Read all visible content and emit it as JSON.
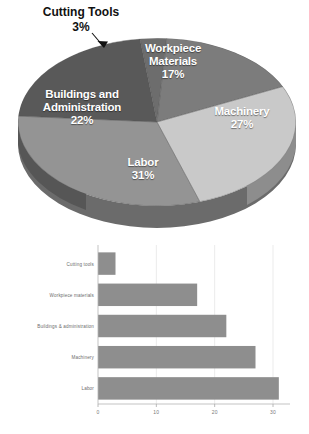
{
  "page": {
    "background": "#ffffff"
  },
  "colors": {
    "slice_workpiece": "#7c7c7c",
    "slice_machinery": "#c9c9c9",
    "slice_labor": "#949494",
    "slice_buildings": "#5a5a5a",
    "slice_cutting": "#6a6a6a",
    "pie_side_wall": "#6b6b6b",
    "bar_fill": "#8e8e8e",
    "axis": "#a8a8a8",
    "grid": "#e2e2e2",
    "label_text": "#6d6d6d",
    "callout_text": "#111111"
  },
  "pie": {
    "type": "pie",
    "title": "",
    "labels_inside": true,
    "slices": [
      {
        "name": "Workpiece Materials",
        "label": "Workpiece\nMaterials",
        "label_line1": "Workpiece",
        "label_line2": "Materials",
        "value": 17,
        "percent": "17%",
        "color": "#7c7c7c",
        "text_color": "#ffffff"
      },
      {
        "name": "Machinery",
        "label_line1": "Machinery",
        "label_line2": "",
        "value": 27,
        "percent": "27%",
        "color": "#c9c9c9",
        "text_color": "#ffffff"
      },
      {
        "name": "Labor",
        "label_line1": "Labor",
        "label_line2": "",
        "value": 31,
        "percent": "31%",
        "color": "#949494",
        "text_color": "#ffffff"
      },
      {
        "name": "Buildings and Administration",
        "label_line1": "Buildings and",
        "label_line2": "Administration",
        "value": 22,
        "percent": "22%",
        "color": "#5a5a5a",
        "text_color": "#ffffff"
      },
      {
        "name": "Cutting Tools",
        "label_line1": "Cutting Tools",
        "label_line2": "",
        "value": 3,
        "percent": "3%",
        "color": "#6a6a6a",
        "text_color": "#111111",
        "callout": true
      }
    ]
  },
  "chart_data": {
    "type": "bar",
    "orientation": "horizontal",
    "title": "",
    "xlabel": "",
    "ylabel": "",
    "categories": [
      "Cutting tools",
      "Workpiece materials",
      "Buildings & administration",
      "Machinery",
      "Labor"
    ],
    "values": [
      3,
      17,
      22,
      27,
      31
    ],
    "xlim": [
      0,
      33
    ],
    "xticks": [
      0,
      10,
      20,
      30
    ],
    "xtick_labels": [
      "0",
      "10",
      "20",
      "30"
    ],
    "grid": true,
    "legend": "none",
    "series": [
      {
        "name": "Percent of manufacturing cost",
        "values": [
          3,
          17,
          22,
          27,
          31
        ]
      }
    ]
  }
}
